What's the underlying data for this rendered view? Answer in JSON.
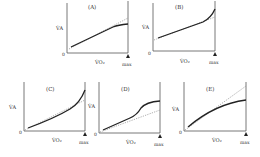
{
  "figure": {
    "y_axis_label": "V̇A",
    "x_axis_label": "V̇O₂",
    "origin_label": "0",
    "max_label": "max",
    "panels": [
      {
        "id": "A",
        "title": "(A)",
        "shape": "linear then flattens below dotted line near max"
      },
      {
        "id": "B",
        "title": "(B)",
        "shape": "linear then rises steeply above dotted line near max"
      },
      {
        "id": "C",
        "title": "(C)",
        "shape": "convex curve rising above dotted line toward max"
      },
      {
        "id": "D",
        "title": "(D)",
        "shape": "sigmoid-like, rises above dotted line then plateaus"
      },
      {
        "id": "E",
        "title": "(E)",
        "shape": "concave curve falling below dotted line toward max"
      }
    ]
  }
}
